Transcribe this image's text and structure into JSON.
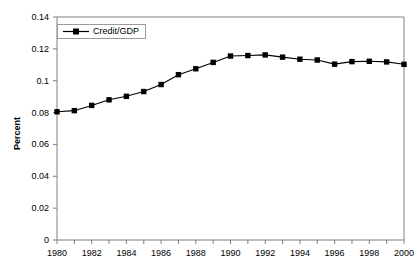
{
  "chart_data": {
    "type": "line",
    "title": "",
    "xlabel": "",
    "ylabel": "Percent",
    "xlim": [
      1980,
      2000
    ],
    "ylim": [
      0,
      0.14
    ],
    "grid": false,
    "legend_position": "top-left",
    "x": [
      1980,
      1981,
      1982,
      1983,
      1984,
      1985,
      1986,
      1987,
      1988,
      1989,
      1990,
      1991,
      1992,
      1993,
      1994,
      1995,
      1996,
      1997,
      1998,
      1999,
      2000
    ],
    "series": [
      {
        "name": "Credit/GDP",
        "marker": "square",
        "color": "#000000",
        "values": [
          0.0805,
          0.0812,
          0.0845,
          0.088,
          0.0902,
          0.0932,
          0.0976,
          0.1038,
          0.1075,
          0.1115,
          0.1155,
          0.1158,
          0.1162,
          0.1148,
          0.1135,
          0.113,
          0.1104,
          0.112,
          0.1122,
          0.1118,
          0.1103
        ]
      }
    ],
    "xticks": [
      1980,
      1981,
      1982,
      1983,
      1984,
      1985,
      1986,
      1987,
      1988,
      1989,
      1990,
      1991,
      1992,
      1993,
      1994,
      1995,
      1996,
      1997,
      1998,
      1999,
      2000
    ],
    "xtick_labels": [
      "1980",
      "",
      "1982",
      "",
      "1984",
      "",
      "1986",
      "",
      "1988",
      "",
      "1990",
      "",
      "1992",
      "",
      "1994",
      "",
      "1996",
      "",
      "1998",
      "",
      "2000"
    ],
    "yticks": [
      0,
      0.02,
      0.04,
      0.06,
      0.08,
      0.1,
      0.12,
      0.14
    ],
    "ytick_labels": [
      "0",
      "0.02",
      "0.04",
      "0.06",
      "0.08",
      "0.1",
      "0.12",
      "0.14"
    ]
  },
  "legend": {
    "entries": [
      {
        "label": "Credit/GDP"
      }
    ]
  },
  "axes": {
    "y_title": "Percent"
  }
}
